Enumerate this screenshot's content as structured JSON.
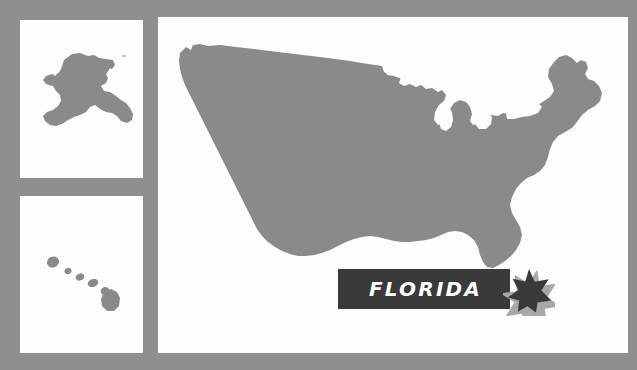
{
  "graphic": {
    "kind": "us-state-locator-map",
    "highlighted_state": "Florida",
    "banner_label": "FLORIDA",
    "colors": {
      "background": "#8f8f8f",
      "panel": "#fdfdfd",
      "land": "#8a8a8a",
      "banner": "#3a3a3a",
      "banner_text": "#ffffff",
      "star": "#3a3a3a",
      "star_glow": "#a8a8a8"
    }
  },
  "panels": [
    {
      "name": "alaska",
      "label": "Alaska inset",
      "icon": "alaska-shape"
    },
    {
      "name": "hawaii",
      "label": "Hawaii inset",
      "icon": "hawaii-islands-shape"
    },
    {
      "name": "mainland",
      "label": "Contiguous United States",
      "icon": "usa-mainland-shape"
    }
  ],
  "marker": {
    "icon": "six-point-star-icon",
    "state": "Florida",
    "points": 6
  }
}
